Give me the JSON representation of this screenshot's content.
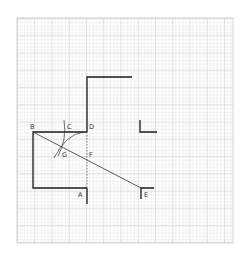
{
  "diagram": {
    "grid": {
      "x": 17,
      "y": 18,
      "width": 216,
      "height": 225,
      "spacing": 3.45,
      "color": "#cfcfcf",
      "major_color": "#b8b8b8"
    },
    "labels": {
      "A": "A",
      "B": "B",
      "C": "C",
      "D": "D",
      "E": "E",
      "F": "F",
      "G": "G"
    },
    "colors": {
      "line": "#1a1a1a",
      "thin": "#333333",
      "background": "#ffffff"
    }
  }
}
